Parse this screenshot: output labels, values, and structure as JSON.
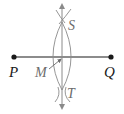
{
  "diagram": {
    "type": "perpendicular-bisector-construction",
    "points": {
      "P": {
        "label": "P"
      },
      "Q": {
        "label": "Q"
      },
      "S": {
        "label": "S"
      },
      "T": {
        "label": "T"
      },
      "M": {
        "label": "M"
      }
    },
    "colors": {
      "segment": "#1a1a1a",
      "construction": "#8a8a8a",
      "label_dark": "#1a1a1a",
      "label_gray": "#6b6b6b"
    }
  }
}
